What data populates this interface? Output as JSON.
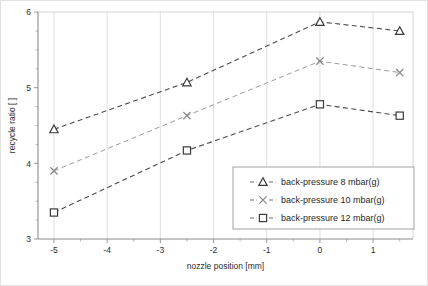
{
  "chart_data": {
    "type": "line",
    "title": "",
    "xlabel": "nozzle position [mm]",
    "ylabel": "recycle ratio [ ]",
    "x": [
      -5,
      -2.5,
      0,
      1.5
    ],
    "xlim": [
      -5.3,
      1.75
    ],
    "ylim": [
      3,
      6
    ],
    "xticks": [
      -5,
      -4,
      -3,
      -2,
      -1,
      0,
      1
    ],
    "xticklabels": [
      "-5",
      "-4",
      "-3",
      "-2",
      "-1",
      "0",
      "1"
    ],
    "yticks": [
      3,
      4,
      5,
      6
    ],
    "yticklabels": [
      "3",
      "4",
      "5",
      "6"
    ],
    "yminorticks": [
      3.25,
      3.5,
      3.75,
      4.25,
      4.5,
      4.75,
      5.25,
      5.5,
      5.75
    ],
    "grid": "vertical-major",
    "legend_position": "lower-right-inside",
    "series": [
      {
        "name": "back-pressure 8 mbar(g)",
        "marker": "triangle",
        "values": [
          4.45,
          5.07,
          5.87,
          5.75
        ]
      },
      {
        "name": "back-pressure 10 mbar(g)",
        "marker": "x",
        "values": [
          3.9,
          4.63,
          5.35,
          5.2
        ]
      },
      {
        "name": "back-pressure 12 mbar(g)",
        "marker": "square",
        "values": [
          3.35,
          4.17,
          4.78,
          4.63
        ]
      }
    ]
  },
  "colors": {
    "axis": "#8c8c8c",
    "grid": "#d8d8d8",
    "series_dark": "#4a4a4a",
    "series_light": "#9b9b9b",
    "text": "#2b2b2b",
    "background": "#ffffff",
    "frame": "#e2e2e2"
  }
}
